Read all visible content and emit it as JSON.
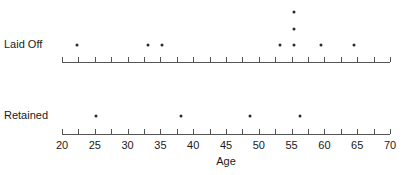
{
  "chart_data": {
    "type": "scatter",
    "title": "",
    "xlabel": "Age",
    "ylabel": "",
    "xlim": [
      20,
      70
    ],
    "xticks": [
      20,
      25,
      30,
      35,
      40,
      45,
      50,
      55,
      60,
      65,
      70
    ],
    "xtick_labels": [
      "20",
      "25",
      "30",
      "35",
      "40",
      "45",
      "50",
      "55",
      "60",
      "65",
      "70"
    ],
    "minor_tick_step": 2.5,
    "grid": false,
    "legend": false,
    "groups": [
      {
        "name": "Laid Off",
        "label": "Laid Off",
        "values": [
          22.3,
          33.1,
          35.2,
          53.2,
          55.4,
          55.4,
          55.4,
          55.4,
          59.5,
          64.5
        ],
        "stacked_points": [
          {
            "age": 22.3,
            "stack": 0
          },
          {
            "age": 33.1,
            "stack": 0
          },
          {
            "age": 35.2,
            "stack": 0
          },
          {
            "age": 53.2,
            "stack": 0
          },
          {
            "age": 55.4,
            "stack": 0
          },
          {
            "age": 55.4,
            "stack": 1
          },
          {
            "age": 55.4,
            "stack": 2
          },
          {
            "age": 55.4,
            "stack": 3
          },
          {
            "age": 59.5,
            "stack": 0
          },
          {
            "age": 64.5,
            "stack": 0
          }
        ],
        "count": 10
      },
      {
        "name": "Retained",
        "label": "Retained",
        "values": [
          25.2,
          38.1,
          48.7,
          56.3
        ],
        "stacked_points": [
          {
            "age": 25.2,
            "stack": 0
          },
          {
            "age": 38.1,
            "stack": 0
          },
          {
            "age": 48.7,
            "stack": 0
          },
          {
            "age": 56.3,
            "stack": 0
          }
        ],
        "count": 4
      }
    ],
    "colors": {
      "dot": "#2b2b2b",
      "axis": "#555555",
      "text": "#1a1a1a",
      "background": "#ffffff"
    }
  },
  "labels": {
    "laid_off": "Laid Off",
    "retained": "Retained",
    "x_axis_title": "Age"
  }
}
